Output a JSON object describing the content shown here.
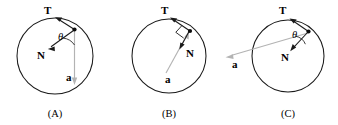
{
  "figure": {
    "background_color": "#ffffff",
    "stroke_color": "#1a1a1a",
    "accel_vector_color": "#b3b3b3"
  },
  "panels": [
    {
      "id": "A",
      "caption": "(A)",
      "circle": {
        "cx": 55,
        "cy": 56,
        "r": 38
      },
      "contact_point": {
        "x": 74.5,
        "y": 29.5,
        "label": "contact-point"
      },
      "vectors": [
        {
          "name": "tension",
          "label": "T",
          "label_x": 44,
          "label_y": 14,
          "from": {
            "x": 74.5,
            "y": 29.5
          },
          "to": {
            "x": 55.5,
            "y": 17.5
          },
          "color": "#1a1a1a",
          "style": "tangent, points up-left"
        },
        {
          "name": "normal",
          "label": "N",
          "label_x": 37,
          "label_y": 59,
          "from": {
            "x": 73.5,
            "y": 30.5
          },
          "to": {
            "x": 48.5,
            "y": 48.5
          },
          "color": "#1a1a1a",
          "style": "radial inward, points down-left"
        },
        {
          "name": "acceleration",
          "label": "a",
          "label_x": 66,
          "label_y": 81,
          "from": {
            "x": 74.5,
            "y": 31
          },
          "to": {
            "x": 74.5,
            "y": 84
          },
          "color": "#b3b3b3",
          "style": "vertical, points straight down"
        }
      ],
      "angle": {
        "symbol": "θ",
        "label_x": 58,
        "label_y": 40,
        "shown": true
      },
      "right_angle_marker": false
    },
    {
      "id": "B",
      "caption": "(B)",
      "circle": {
        "cx": 59,
        "cy": 56,
        "r": 37
      },
      "contact_point": {
        "x": 80,
        "y": 31,
        "label": "contact-point"
      },
      "vectors": [
        {
          "name": "tension",
          "label": "T",
          "label_x": 51,
          "label_y": 14,
          "from": {
            "x": 80,
            "y": 31
          },
          "to": {
            "x": 60.5,
            "y": 17.5
          },
          "color": "#1a1a1a",
          "style": "tangent, points up-left"
        },
        {
          "name": "normal",
          "label": "N",
          "label_x": 76,
          "label_y": 57,
          "from": {
            "x": 79,
            "y": 31.5
          },
          "to": {
            "x": 69.5,
            "y": 49
          },
          "color": "#1a1a1a",
          "style": "radial inward, points down-left"
        },
        {
          "name": "acceleration",
          "label": "a",
          "label_x": 55,
          "label_y": 83,
          "from": {
            "x": 56,
            "y": 73
          },
          "to": {
            "x": 78,
            "y": 33
          },
          "color": "#b3b3b3",
          "style": "from center outward toward contact point"
        }
      ],
      "angle": {
        "symbol": "θ",
        "shown": false
      },
      "right_angle_marker": true
    },
    {
      "id": "C",
      "caption": "(C)",
      "circle": {
        "cx": 68,
        "cy": 56,
        "r": 36
      },
      "contact_point": {
        "x": 88.5,
        "y": 31.5,
        "label": "contact-point"
      },
      "vectors": [
        {
          "name": "tension",
          "label": "T",
          "label_x": 59,
          "label_y": 14,
          "from": {
            "x": 88.5,
            "y": 31.5
          },
          "to": {
            "x": 70,
            "y": 18.5
          },
          "color": "#1a1a1a",
          "style": "tangent, points up-left"
        },
        {
          "name": "normal",
          "label": "N",
          "label_x": 61,
          "label_y": 61,
          "from": {
            "x": 87.5,
            "y": 32.5
          },
          "to": {
            "x": 70.5,
            "y": 51
          },
          "color": "#1a1a1a",
          "style": "radial inward, points down-left"
        },
        {
          "name": "acceleration",
          "label": "a",
          "label_x": 12,
          "label_y": 68,
          "from": {
            "x": 88,
            "y": 33
          },
          "to": {
            "x": 6,
            "y": 56.5
          },
          "color": "#b3b3b3",
          "style": "long chord extending left beyond the circle"
        }
      ],
      "angle": {
        "symbol": "θ",
        "label_x": 72,
        "label_y": 38,
        "shown": true
      },
      "right_angle_marker": false
    }
  ]
}
